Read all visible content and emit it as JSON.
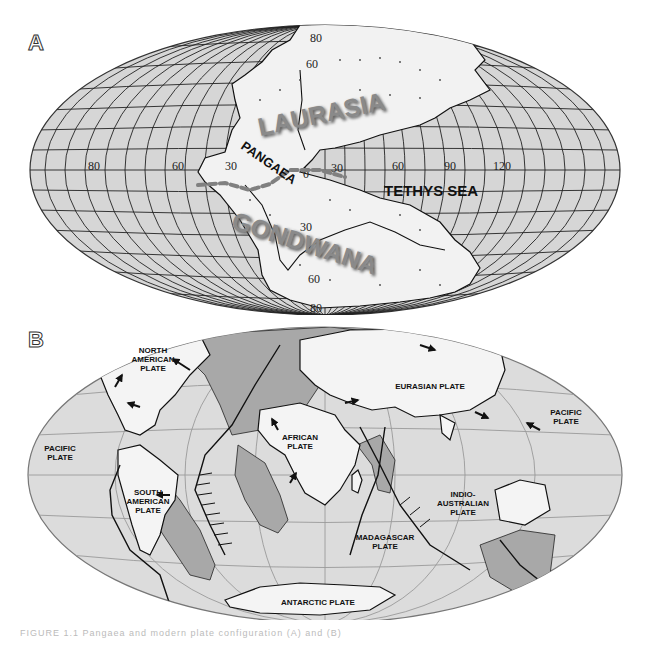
{
  "figure": {
    "panel_a": {
      "letter": "A",
      "landmass_labels": {
        "laurasia": "LAURASIA",
        "pangaea": "PANGAEA",
        "gondwana": "GONDWANA",
        "tethys": "TETHYS SEA"
      },
      "longitude_labels": [
        "80",
        "60",
        "30",
        "0",
        "30",
        "60",
        "90",
        "120"
      ],
      "latitude_labels": [
        "80",
        "60",
        "30",
        "0",
        "30",
        "60",
        "80"
      ],
      "colors": {
        "ocean": "#d6d6d6",
        "land": "#f2f2f2",
        "grid": "#222222",
        "label_shadow": "#6f6f6f",
        "equator_dash": "#777777"
      }
    },
    "panel_b": {
      "letter": "B",
      "plates": [
        {
          "id": "north-american",
          "line1": "NORTH",
          "line2": "AMERICAN",
          "line3": "PLATE"
        },
        {
          "id": "eurasian",
          "line1": "EURASIAN PLATE"
        },
        {
          "id": "pacific-west",
          "line1": "PACIFIC",
          "line2": "PLATE"
        },
        {
          "id": "pacific-east",
          "line1": "PACIFIC",
          "line2": "PLATE"
        },
        {
          "id": "african",
          "line1": "AFRICAN",
          "line2": "PLATE"
        },
        {
          "id": "south-american",
          "line1": "SOUTH",
          "line2": "AMERICAN",
          "line3": "PLATE"
        },
        {
          "id": "indo-australian",
          "line1": "INDIO-",
          "line2": "AUSTRALIAN",
          "line3": "PLATE"
        },
        {
          "id": "madagascar",
          "line1": "MADAGASCAR",
          "line2": "PLATE"
        },
        {
          "id": "antarctic",
          "line1": "ANTARCTIC PLATE"
        }
      ],
      "colors": {
        "ocean": "#dcdcdc",
        "land": "#f4f4f4",
        "shelf": "#a8a8a8",
        "grid": "#9a9a9a",
        "boundary": "#111111"
      }
    }
  },
  "caption": {
    "text": "FIGURE 1.1 Pangaea and modern plate configuration (A) and (B)"
  }
}
